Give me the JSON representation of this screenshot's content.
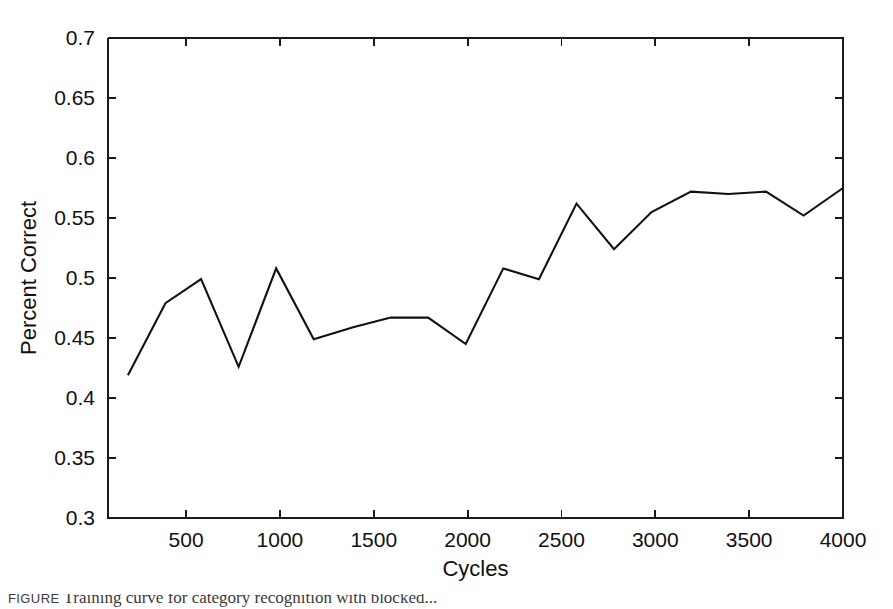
{
  "figure": {
    "background_color": "#ffffff",
    "line_color": "#111111",
    "axis_color": "#1a1a1a",
    "caption_label": "FIGURE",
    "caption_text": "Training curve for category recognition with blocked..."
  },
  "chart_data": {
    "type": "line",
    "title": "",
    "xlabel": "Cycles",
    "ylabel": "Percent Correct",
    "xlim": [
      84,
      4000
    ],
    "ylim": [
      0.3,
      0.7
    ],
    "grid": false,
    "legend": null,
    "xticks": [
      500,
      1000,
      1500,
      2000,
      2500,
      3000,
      3500,
      4000
    ],
    "xtick_labels": [
      "500",
      "1000",
      "1500",
      "2000",
      "2500",
      "3000",
      "3500",
      "4000"
    ],
    "yticks": [
      0.3,
      0.35,
      0.4,
      0.45,
      0.5,
      0.55,
      0.6,
      0.65,
      0.7
    ],
    "ytick_labels": [
      "0.3",
      "0.35",
      "0.4",
      "0.45",
      "0.5",
      "0.55",
      "0.6",
      "0.65",
      "0.7"
    ],
    "series": [
      {
        "name": "Percent Correct",
        "x": [
          190,
          390,
          580,
          780,
          980,
          1180,
          1390,
          1590,
          1790,
          1990,
          2190,
          2380,
          2580,
          2780,
          2980,
          3190,
          3390,
          3590,
          3790,
          4000
        ],
        "values": [
          0.419,
          0.479,
          0.499,
          0.426,
          0.508,
          0.449,
          0.459,
          0.467,
          0.467,
          0.445,
          0.508,
          0.499,
          0.562,
          0.524,
          0.555,
          0.572,
          0.57,
          0.572,
          0.552,
          0.575
        ]
      }
    ]
  }
}
